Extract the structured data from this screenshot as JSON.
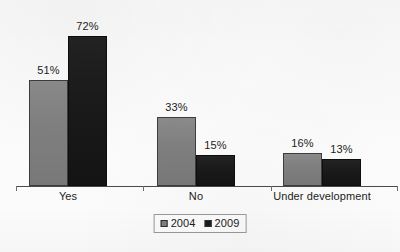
{
  "chart_data": {
    "type": "bar",
    "title": "",
    "subtitle": "",
    "xlabel": "",
    "ylabel": "",
    "categories": [
      "Yes",
      "No",
      "Under development"
    ],
    "series": [
      {
        "name": "2004",
        "color": "#808080",
        "values": [
          51,
          33,
          16
        ],
        "labels": [
          "51%",
          "33%",
          "16%"
        ]
      },
      {
        "name": "2009",
        "color": "#1a1a1a",
        "values": [
          72,
          15,
          13
        ],
        "labels": [
          "72%",
          "15%",
          "13%"
        ]
      }
    ],
    "value_suffix": "%",
    "ylim": [
      0,
      85
    ],
    "grid": false,
    "y_axis_visible": false,
    "x_axis_visible": true,
    "legend_position": "bottom-center",
    "legend_entries": [
      "2004",
      "2009"
    ]
  },
  "legend": {
    "items": [
      {
        "label": "2004",
        "swatch": "legend-swatch-2004"
      },
      {
        "label": "2009",
        "swatch": "legend-swatch-2009"
      }
    ]
  },
  "caption": {
    "text": ""
  },
  "colors": {
    "background": "#fbfbfb",
    "series_2004": "#808080",
    "series_2009": "#1a1a1a",
    "axis": "#4a4a4a",
    "text": "#1b1b1b"
  }
}
